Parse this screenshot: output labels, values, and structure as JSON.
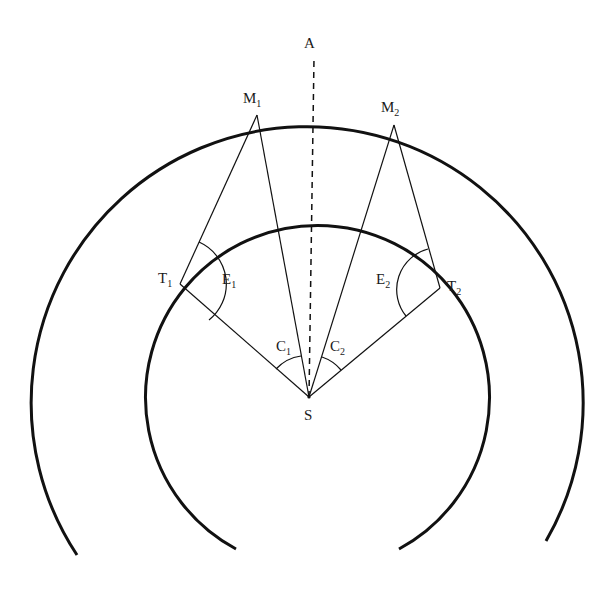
{
  "diagram": {
    "type": "geometric-construction",
    "colors": {
      "stroke": "#111111",
      "background": "#ffffff"
    },
    "circles": {
      "outer": {
        "cx": 307,
        "cy": 383,
        "r": 276,
        "start": [
          77,
          555
        ],
        "end": [
          546,
          541
        ]
      },
      "inner": {
        "cx": 306,
        "cy": 397,
        "r": 172,
        "start": [
          236,
          549
        ],
        "end": [
          399,
          549
        ]
      }
    },
    "points": {
      "A": {
        "label": "A",
        "sub": "",
        "x": 314,
        "y": 48
      },
      "M1": {
        "label": "M",
        "sub": "1",
        "x": 257,
        "y": 115
      },
      "M2": {
        "label": "M",
        "sub": "2",
        "x": 394,
        "y": 125
      },
      "T1": {
        "label": "T",
        "sub": "1",
        "x": 180,
        "y": 284
      },
      "T2": {
        "label": "T",
        "sub": "2",
        "x": 440,
        "y": 288
      },
      "S": {
        "label": "S",
        "sub": "",
        "x": 309,
        "y": 397
      }
    },
    "angles": {
      "E1": {
        "label": "E",
        "sub": "1"
      },
      "E2": {
        "label": "E",
        "sub": "2"
      },
      "C1": {
        "label": "C",
        "sub": "1"
      },
      "C2": {
        "label": "C",
        "sub": "2"
      }
    },
    "axis": {
      "from": "S",
      "to": "A",
      "style": "dashed"
    }
  }
}
